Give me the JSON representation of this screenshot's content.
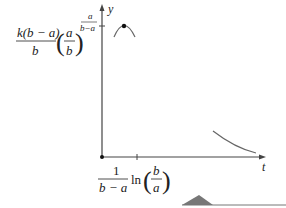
{
  "diagram": {
    "type": "function-graph",
    "axes": {
      "x_label": "t",
      "y_label": "y",
      "origin_marked": true
    },
    "y_tick_label": {
      "numerator": "k(b − a)",
      "denominator": "b",
      "paren_num": "a",
      "paren_den": "b",
      "exp_num": "a",
      "exp_den": "b−a"
    },
    "x_tick_label": {
      "frac_num": "1",
      "frac_den": "b − a",
      "ln": "ln",
      "paren_num": "b",
      "paren_den": "a"
    },
    "curve": {
      "description": "curve rises to a maximum point then decays toward zero",
      "max_point_marked": true
    },
    "colors": {
      "axis": "#444444",
      "curve": "#666666",
      "point": "#111111",
      "shape": "#777777"
    }
  }
}
